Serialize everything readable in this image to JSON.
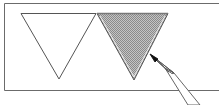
{
  "illustration": {
    "description": "Two inverted triangles side by side in a frame; the right triangle is shaded by a pencil",
    "colors": {
      "background": "#ffffff",
      "stroke": "#555555",
      "shade": "#b8b8b8",
      "pencil_tip": "#111111"
    },
    "frame": {
      "left": 4,
      "top": 3,
      "bottom": 90
    },
    "triangles": [
      {
        "id": "outline",
        "points": "21,13 96,13 59,79",
        "shaded": false
      },
      {
        "id": "shaded",
        "points": "96,13 168,13 134,79",
        "shaded": true
      }
    ],
    "pencil": {
      "tip_x": 151,
      "tip_y": 55,
      "angle_deg": 45
    }
  }
}
